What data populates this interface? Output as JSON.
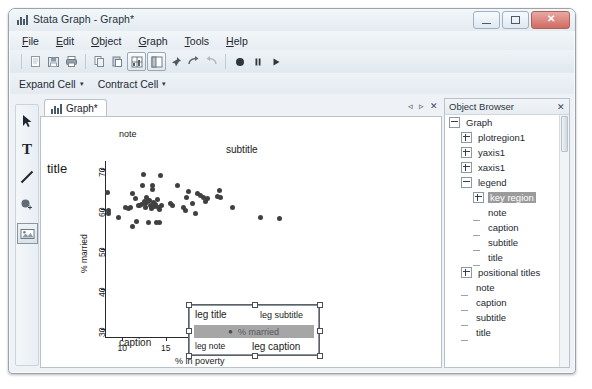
{
  "window": {
    "title": "Stata Graph - Graph*",
    "app_icon": "bar-chart-icon",
    "buttons": {
      "minimize": "minimize-icon",
      "maximize": "maximize-icon",
      "close": "✕"
    }
  },
  "menubar": {
    "items": [
      {
        "label": "File",
        "accel": "F"
      },
      {
        "label": "Edit",
        "accel": "E"
      },
      {
        "label": "Object",
        "accel": "O"
      },
      {
        "label": "Graph",
        "accel": "G"
      },
      {
        "label": "Tools",
        "accel": "T"
      },
      {
        "label": "Help",
        "accel": "H"
      }
    ]
  },
  "toolbar": {
    "items": [
      {
        "name": "new-icon",
        "pressed": false
      },
      {
        "name": "save-icon",
        "pressed": false
      },
      {
        "name": "print-icon",
        "pressed": false
      },
      {
        "name": "copy-icon",
        "pressed": false
      },
      {
        "name": "paste-icon",
        "pressed": false
      },
      {
        "name": "grid-icon",
        "pressed": true
      },
      {
        "name": "object-browser-icon",
        "pressed": true
      },
      {
        "name": "pin-icon",
        "pressed": false
      },
      {
        "name": "redo-icon",
        "pressed": false
      },
      {
        "name": "undo-icon",
        "pressed": false
      },
      {
        "name": "record-icon",
        "pressed": false
      },
      {
        "name": "pause-icon",
        "pressed": false
      },
      {
        "name": "play-icon",
        "pressed": false
      }
    ]
  },
  "toolbar2": {
    "expand_cell": "Expand Cell",
    "contract_cell": "Contract Cell",
    "caret": "▾"
  },
  "tools": {
    "items": [
      {
        "name": "pointer-tool",
        "glyph": "pointer",
        "selected": false
      },
      {
        "name": "text-tool",
        "glyph": "T",
        "selected": false
      },
      {
        "name": "line-tool",
        "glyph": "line",
        "selected": false
      },
      {
        "name": "marker-tool",
        "glyph": "marker",
        "selected": false
      },
      {
        "name": "image-tool",
        "glyph": "image",
        "selected": true
      }
    ]
  },
  "document": {
    "tab_label": "Graph*",
    "tab_icon": "bar-chart-icon",
    "nav_prev": "◃",
    "nav_next": "▹",
    "nav_close": "✕"
  },
  "chart_data": {
    "type": "scatter",
    "title": "title",
    "subtitle": "subtitle",
    "note": "note",
    "caption": "caption",
    "xlabel": "% in poverty",
    "ylabel": "% married",
    "xlim": [
      8,
      30.5
    ],
    "ylim": [
      28,
      72
    ],
    "xticks": [
      10,
      15,
      20,
      25,
      30
    ],
    "yticks": [
      30,
      40,
      50,
      60,
      70
    ],
    "grid": false,
    "series": [
      {
        "name": "% married",
        "marker": "circle",
        "color": "#404040",
        "points": [
          [
            8.3,
            64.2
          ],
          [
            8.4,
            59.6
          ],
          [
            8.4,
            58.8
          ],
          [
            9.6,
            58.0
          ],
          [
            10.4,
            60.3
          ],
          [
            10.7,
            60.2
          ],
          [
            10.9,
            60.4
          ],
          [
            11.1,
            55.6
          ],
          [
            11.2,
            64.0
          ],
          [
            11.5,
            62.6
          ],
          [
            11.6,
            57.0
          ],
          [
            11.8,
            61.0
          ],
          [
            12.0,
            60.8
          ],
          [
            12.2,
            61.2
          ],
          [
            12.3,
            66.0
          ],
          [
            12.4,
            68.6
          ],
          [
            12.5,
            62.0
          ],
          [
            12.6,
            61.4
          ],
          [
            12.7,
            60.4
          ],
          [
            12.8,
            63.0
          ],
          [
            12.9,
            61.8
          ],
          [
            13.0,
            56.7
          ],
          [
            13.1,
            62.2
          ],
          [
            13.2,
            61.0
          ],
          [
            13.3,
            60.2
          ],
          [
            13.4,
            65.8
          ],
          [
            13.5,
            65.0
          ],
          [
            13.6,
            61.6
          ],
          [
            13.7,
            60.7
          ],
          [
            13.8,
            61.1
          ],
          [
            13.9,
            56.6
          ],
          [
            14.0,
            62.4
          ],
          [
            14.1,
            60.3
          ],
          [
            14.2,
            56.6
          ],
          [
            14.3,
            60.0
          ],
          [
            14.4,
            68.3
          ],
          [
            14.5,
            61.0
          ],
          [
            15.5,
            61.4
          ],
          [
            15.7,
            60.8
          ],
          [
            16.3,
            65.8
          ],
          [
            17.0,
            60.3
          ],
          [
            17.2,
            59.6
          ],
          [
            17.4,
            62.8
          ],
          [
            17.6,
            64.4
          ],
          [
            18.0,
            61.3
          ],
          [
            18.4,
            59.0
          ],
          [
            18.6,
            63.8
          ],
          [
            19.0,
            63.4
          ],
          [
            19.3,
            63.0
          ],
          [
            19.5,
            61.8
          ],
          [
            19.8,
            62.6
          ],
          [
            20.2,
            31.6
          ],
          [
            20.9,
            63.2
          ],
          [
            21.2,
            64.6
          ],
          [
            21.3,
            62.8
          ],
          [
            22.6,
            60.4
          ],
          [
            25.8,
            58.0
          ],
          [
            28.0,
            57.6
          ]
        ]
      }
    ],
    "legend": {
      "title": "leg title",
      "subtitle": "leg subtitle",
      "note": "leg note",
      "caption": "leg caption",
      "key_label": "% married",
      "key_marker": "●",
      "key_selected": true
    }
  },
  "object_browser": {
    "header": "Object Browser",
    "close_icon": "✕",
    "tree": [
      {
        "label": "Graph",
        "depth": 0,
        "expander": "minus",
        "selected": false
      },
      {
        "label": "plotregion1",
        "depth": 1,
        "expander": "plus",
        "selected": false
      },
      {
        "label": "yaxis1",
        "depth": 1,
        "expander": "plus",
        "selected": false
      },
      {
        "label": "xaxis1",
        "depth": 1,
        "expander": "plus",
        "selected": false
      },
      {
        "label": "legend",
        "depth": 1,
        "expander": "minus",
        "selected": false
      },
      {
        "label": "key region",
        "depth": 2,
        "expander": "plus",
        "selected": true
      },
      {
        "label": "note",
        "depth": 2,
        "expander": "none",
        "selected": false
      },
      {
        "label": "caption",
        "depth": 2,
        "expander": "none",
        "selected": false
      },
      {
        "label": "subtitle",
        "depth": 2,
        "expander": "none",
        "selected": false
      },
      {
        "label": "title",
        "depth": 2,
        "expander": "none",
        "selected": false
      },
      {
        "label": "positional titles",
        "depth": 1,
        "expander": "plus",
        "selected": false
      },
      {
        "label": "note",
        "depth": 1,
        "expander": "none",
        "selected": false
      },
      {
        "label": "caption",
        "depth": 1,
        "expander": "none",
        "selected": false
      },
      {
        "label": "subtitle",
        "depth": 1,
        "expander": "none",
        "selected": false
      },
      {
        "label": "title",
        "depth": 1,
        "expander": "none",
        "selected": false
      }
    ]
  }
}
